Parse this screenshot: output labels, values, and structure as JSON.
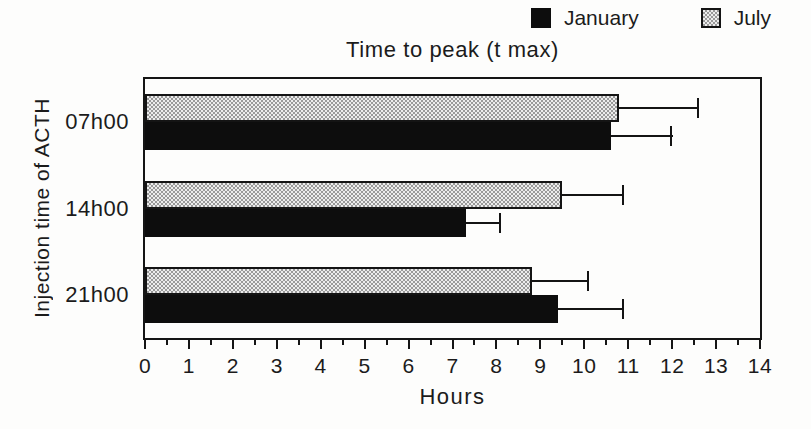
{
  "figure": {
    "background": "#fdfdfc",
    "ink": "#1b1b1b",
    "bar_black": "#0d0d0d",
    "stipple_base": "#ececec",
    "stipple_dot": "#999999"
  },
  "legend": {
    "items": [
      {
        "label": "January",
        "swatch": "solid-black-square"
      },
      {
        "label": "July",
        "swatch": "stippled-square"
      }
    ]
  },
  "chart_data": {
    "type": "bar",
    "orientation": "horizontal",
    "title": "Time to peak (t max)",
    "xlabel": "Hours",
    "ylabel": "Injection time of ACTH",
    "categories": [
      "07h00",
      "14h00",
      "21h00"
    ],
    "series": [
      {
        "name": "January",
        "pattern": "solid-black",
        "values": [
          10.6,
          7.3,
          9.4
        ],
        "error_plus": [
          1.4,
          0.8,
          1.5
        ]
      },
      {
        "name": "July",
        "pattern": "stippled",
        "values": [
          10.8,
          9.5,
          8.8
        ],
        "error_plus": [
          1.8,
          1.4,
          1.3
        ]
      }
    ],
    "xlim": [
      0,
      14
    ],
    "xtick_step": 1,
    "xtick_minor_step": 0.5,
    "xtick_labels": [
      "0",
      "1",
      "2",
      "3",
      "4",
      "5",
      "6",
      "7",
      "8",
      "9",
      "10",
      "11",
      "12",
      "13",
      "14"
    ],
    "grid": false,
    "legend_position": "top-right",
    "bar_row_order_top_to_bottom": [
      "July",
      "January"
    ],
    "error_bar_style": "plus-direction-with-end-cap"
  }
}
